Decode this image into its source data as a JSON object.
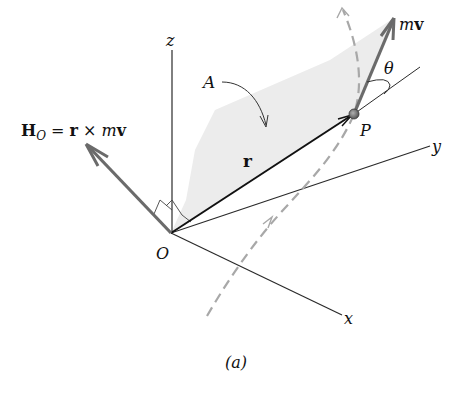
{
  "figure": {
    "caption": "(a)",
    "labels": {
      "z_axis": "z",
      "y_axis": "y",
      "x_axis": "x",
      "origin": "O",
      "point": "P",
      "area": "A",
      "position_vector": "r",
      "momentum_m": "m",
      "momentum_v": "v",
      "angle": "θ",
      "angular_momentum_H": "H",
      "angular_momentum_sub": "O",
      "angular_momentum_eq": " = ",
      "angular_momentum_r": "r",
      "angular_momentum_cross": " × ",
      "angular_momentum_m": "m",
      "angular_momentum_v": "v"
    },
    "colors": {
      "axis": "#2a2a2a",
      "vector_r": "#111111",
      "vector_thick": "#6b6b6b",
      "path_dashed": "#a8a8a8",
      "shaded_area": "#ececec",
      "text": "#111111"
    }
  }
}
